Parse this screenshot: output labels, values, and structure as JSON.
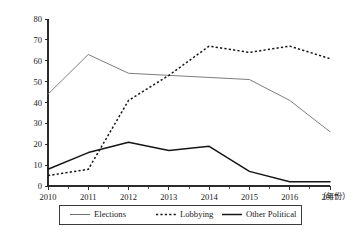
{
  "chart_data": {
    "type": "line",
    "title": "",
    "xlabel": "（年份）",
    "ylabel": "",
    "x": [
      "2010",
      "2011",
      "2012",
      "2013",
      "2014",
      "2015",
      "2016",
      "2017"
    ],
    "categories": [
      "2010",
      "2011",
      "2012",
      "2013",
      "2014",
      "2015",
      "2016",
      "2017"
    ],
    "series": [
      {
        "name": "Elections",
        "style": "solid-thin",
        "color": "#7d7d7d",
        "values": [
          44,
          63,
          54,
          53,
          52,
          51,
          41,
          26
        ]
      },
      {
        "name": "Lobbying",
        "style": "dotted",
        "color": "#161616",
        "values": [
          5,
          8,
          41,
          53,
          67,
          64,
          67,
          61
        ]
      },
      {
        "name": "Other Political",
        "style": "solid-thick",
        "color": "#161616",
        "values": [
          8,
          16,
          21,
          17,
          19,
          7,
          2,
          2
        ]
      }
    ],
    "xlim": [
      2010,
      2017
    ],
    "ylim": [
      0,
      80
    ],
    "yticks": [
      "0",
      "10",
      "20",
      "30",
      "40",
      "50",
      "60",
      "70",
      "80"
    ],
    "ytick_values": [
      0,
      10,
      20,
      30,
      40,
      50,
      60,
      70,
      80
    ],
    "xticks": [
      "2010",
      "2011",
      "2012",
      "2013",
      "2014",
      "2015",
      "2016",
      "2017"
    ],
    "grid": false,
    "legend_position": "bottom-center",
    "minor_ticks_per_interval": 2,
    "background_color": "#ffffff",
    "axis_color": "#2b2b2b"
  },
  "legend": {
    "entries": [
      {
        "label": "Elections",
        "style": "solid-thin"
      },
      {
        "label": "Lobbying",
        "style": "dotted"
      },
      {
        "label": "Other Political",
        "style": "solid-thick"
      }
    ]
  }
}
